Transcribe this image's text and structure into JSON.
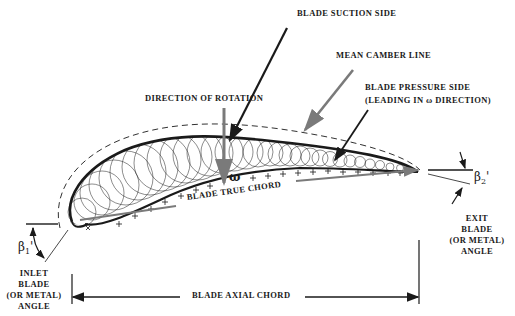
{
  "diagram": {
    "type": "turbine blade cascade cross-section",
    "labels": {
      "suction_side": "BLADE SUCTION SIDE",
      "mean_camber": "MEAN CAMBER LINE",
      "pressure_side_1": "BLADE PRESSURE SIDE",
      "pressure_side_2": "(LEADING IN ω DIRECTION)",
      "rotation": "DIRECTION OF ROTATION",
      "omega": "ω",
      "true_chord": "BLADE TRUE CHORD",
      "axial_chord": "BLADE AXIAL CHORD",
      "inlet_1": "INLET",
      "inlet_2": "BLADE",
      "inlet_3": "(OR METAL)",
      "inlet_4": "ANGLE",
      "exit_1": "EXIT",
      "exit_2": "BLADE",
      "exit_3": "(OR METAL)",
      "exit_4": "ANGLE",
      "beta1": "β",
      "beta1_sub": "1",
      "beta2": "β",
      "beta2_sub": "2"
    },
    "colors": {
      "ink": "#1a1a1a",
      "gray_arrow": "#7a7a7a",
      "background": "#ffffff"
    }
  }
}
